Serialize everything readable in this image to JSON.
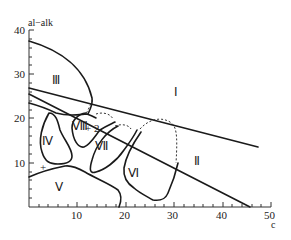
{
  "diagram": {
    "y_axis_label": "al−alk",
    "x_axis_label": "c",
    "y_ticks": [
      "10",
      "20",
      "30",
      "40"
    ],
    "x_ticks": [
      "10",
      "20",
      "30",
      "40",
      "50"
    ],
    "regions": [
      {
        "id": "I",
        "label": "Ⅰ"
      },
      {
        "id": "II",
        "label": "Ⅱ"
      },
      {
        "id": "III",
        "label": "Ⅲ"
      },
      {
        "id": "IV",
        "label": "Ⅳ"
      },
      {
        "id": "V",
        "label": "Ⅴ"
      },
      {
        "id": "VI",
        "label": "Ⅵ"
      },
      {
        "id": "VII",
        "label": "Ⅶ"
      },
      {
        "id": "VIII",
        "label": "Ⅷ"
      }
    ],
    "points": [
      {
        "label": "+ 2"
      },
      {
        "label": "+"
      }
    ],
    "line_color": "#1a1a1a"
  }
}
